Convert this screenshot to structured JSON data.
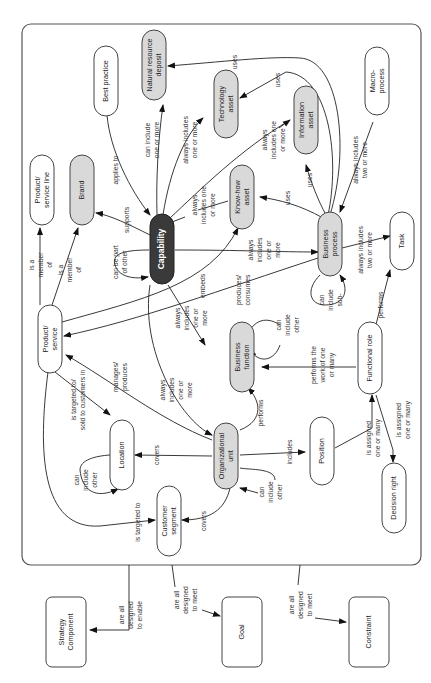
{
  "diagram": {
    "orientation": "rotated 90 degrees counter-clockwise",
    "colors": {
      "core_node": "#3a3a3a",
      "asset_node": "#d9d9d9",
      "plain_node": "#ffffff",
      "line": "#222222"
    },
    "nodes": {
      "capability": "Capability",
      "natural_resource_deposit": [
        "Natural resource",
        "deposit"
      ],
      "technology_asset": [
        "Technology",
        "asset"
      ],
      "information_asset": [
        "Information",
        "asset"
      ],
      "knowhow_asset": [
        "Know-how",
        "asset"
      ],
      "best_practice": "Best practice",
      "macro_process": [
        "Macro-",
        "process"
      ],
      "product_service_line": [
        "Product/",
        "service line"
      ],
      "brand": "Brand",
      "business_process": [
        "Business",
        "process"
      ],
      "task": "Task",
      "product_service": [
        "Product/",
        "service"
      ],
      "business_function": [
        "Business",
        "function"
      ],
      "functional_role": "Functional role",
      "location": "Location",
      "organizational_unit": [
        "Organizational",
        "unit"
      ],
      "position": "Position",
      "decision_right": "Decision right",
      "customer_segment": [
        "Customer",
        "segment"
      ],
      "strategy_component": [
        "Strategy",
        "Component"
      ],
      "goal": "Goal",
      "constraint": "Constraint"
    },
    "edge_labels": {
      "applies_to": "applies to",
      "can_include_one_or_more": [
        "can include",
        "one or more"
      ],
      "always_includes_one_or_more_tech": [
        "always includes",
        "one or more"
      ],
      "always_includes_one_or_more_knowhow": [
        "always",
        "includes one",
        "or more"
      ],
      "always_includes_one_or_more_info": [
        "always",
        "includes one",
        "or more"
      ],
      "uses_nrd": "uses",
      "uses_tech": "uses",
      "uses_info": "uses",
      "uses_knowhow": "uses",
      "always_includes_two_or_more_macro": [
        "always includes",
        "two or more"
      ],
      "supports": "supports",
      "can_be_part_of_other": [
        "can be part",
        "of other"
      ],
      "is_a_member_of_1": [
        "is a",
        "member",
        "of"
      ],
      "is_a_member_of_2": [
        "is a",
        "member",
        "of"
      ],
      "embeds": "embeds",
      "always_includes_one_or_more_bp": [
        "always",
        "includes",
        "one or",
        "more"
      ],
      "always_includes_two_or_more_task": [
        "always includes",
        "two or more"
      ],
      "produces_consumes": [
        "produces/",
        "consumes"
      ],
      "can_include_sub": [
        "can",
        "include",
        "sub-"
      ],
      "always_includes_one_or_more_bf": [
        "always",
        "includes",
        "one or",
        "more"
      ],
      "can_include_other_bf": [
        "can",
        "include",
        "other"
      ],
      "performs_task": "performs",
      "performs_the_work": [
        "performs the",
        "work of one",
        "or many"
      ],
      "manages_produces": [
        "manages/",
        "produces"
      ],
      "always_includes_one_or_more_ou": [
        "always",
        "includes",
        "one or",
        "more"
      ],
      "performs_bf": "performs",
      "is_targeted_sold": [
        "is targeted to/",
        "sold to customers in"
      ],
      "can_include_other_loc": [
        "can",
        "include",
        "other"
      ],
      "covers_loc": "covers",
      "includes_position": "includes",
      "is_assigned_fr": [
        "is assigned",
        "one or many"
      ],
      "is_assigned_dr": [
        "is assigned",
        "one or many"
      ],
      "can_include_other_ou": [
        "can",
        "include",
        "other"
      ],
      "covers_cs": "covers",
      "is_targeted_to": "is targeted to",
      "designed_enable": [
        "are all",
        "designed",
        "to enable"
      ],
      "designed_meet_goal": [
        "are all",
        "designed",
        "to meet"
      ],
      "designed_meet_constraint": [
        "are all",
        "designed",
        "to meet"
      ]
    }
  }
}
